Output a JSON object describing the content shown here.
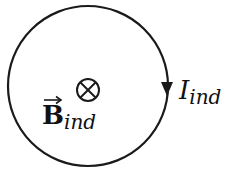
{
  "diagram": {
    "loop": {
      "cx": 88,
      "cy": 86,
      "r": 80,
      "stroke": "#1a1a1a"
    },
    "field_symbol": {
      "name": "into-page-cross",
      "glyph": "⊗"
    },
    "current_label": {
      "main": "I",
      "subscript": "ind"
    },
    "field_label": {
      "main": "B",
      "subscript": "ind",
      "vector_arrow": "→"
    },
    "current_direction": "clockwise"
  }
}
